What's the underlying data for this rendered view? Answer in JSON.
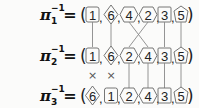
{
  "rows": [
    {
      "label": "π",
      "subscript": "1",
      "superscript": "−1",
      "equals": "=",
      "open": "(",
      "close": ")",
      "items": [
        {
          "value": "1",
          "shape": "square"
        },
        {
          "value": "6",
          "shape": "diamond"
        },
        {
          "value": "4",
          "shape": "hexagon"
        },
        {
          "value": "2",
          "shape": "hexagon"
        },
        {
          "value": "3",
          "shape": "square"
        },
        {
          "value": "5",
          "shape": "pentagon"
        }
      ]
    },
    {
      "label": "π",
      "subscript": "2",
      "superscript": "−1",
      "equals": "=",
      "open": "(",
      "close": ")",
      "items": [
        {
          "value": "1",
          "shape": "square"
        },
        {
          "value": "6",
          "shape": "diamond"
        },
        {
          "value": "2",
          "shape": "hexagon"
        },
        {
          "value": "4",
          "shape": "hexagon"
        },
        {
          "value": "3",
          "shape": "square"
        },
        {
          "value": "5",
          "shape": "pentagon"
        }
      ]
    },
    {
      "label": "π",
      "subscript": "3",
      "superscript": "−1",
      "equals": "=",
      "open": "(",
      "close": ")",
      "items": [
        {
          "value": "6",
          "shape": "diamond"
        },
        {
          "value": "1",
          "shape": "square"
        },
        {
          "value": "2",
          "shape": "hexagon"
        },
        {
          "value": "4",
          "shape": "hexagon"
        },
        {
          "value": "3",
          "shape": "square"
        },
        {
          "value": "5",
          "shape": "pentagon"
        }
      ]
    }
  ],
  "separator": ",",
  "cross_mark": "×",
  "transitions": [
    {
      "from_row": 1,
      "to_row": 2,
      "straight": [
        0,
        1,
        4,
        5
      ],
      "crossed": [
        [
          2,
          3
        ]
      ]
    },
    {
      "from_row": 2,
      "to_row": 3,
      "straight": [
        2,
        3,
        4,
        5
      ],
      "swapped_marks": [
        0,
        1
      ]
    }
  ]
}
